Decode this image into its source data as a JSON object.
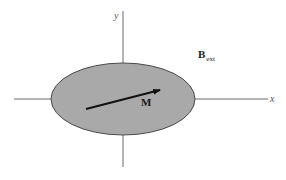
{
  "diagram": {
    "colors": {
      "axis": "#6a6a6a",
      "ellipse_fill": "#a9a9a9",
      "ellipse_stroke": "#4a4a4a",
      "arrow": "#111111"
    },
    "axes": {
      "x_label": "x",
      "y_label": "y"
    },
    "ellipse": {
      "cx": 123,
      "cy": 99,
      "rx": 72,
      "ry": 36
    },
    "vector": {
      "label": "M",
      "from": [
        86,
        109
      ],
      "to": [
        160,
        90
      ]
    },
    "field": {
      "label_main": "B",
      "label_sub": "ext"
    }
  }
}
